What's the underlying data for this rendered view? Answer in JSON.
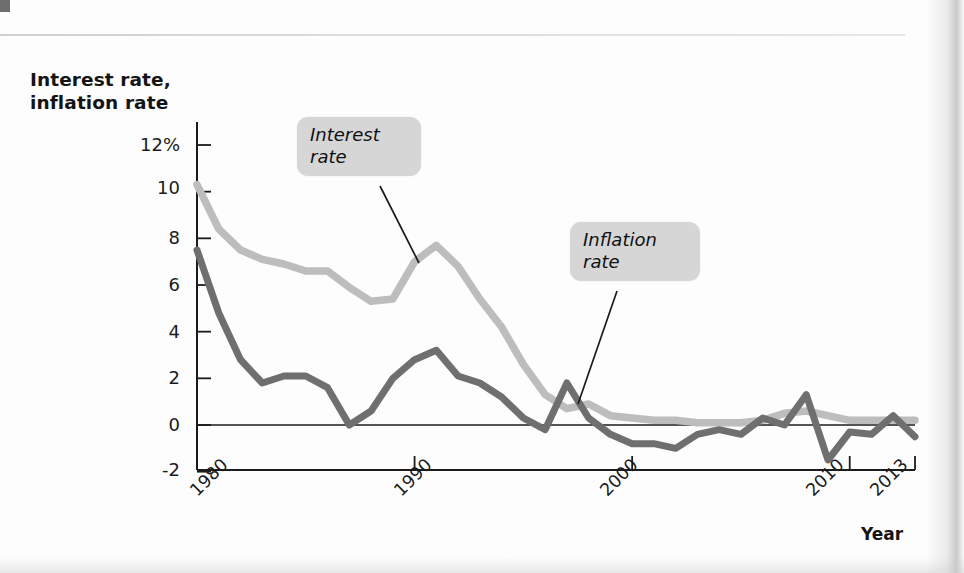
{
  "figure": {
    "y_axis_title_line1": "Interest rate,",
    "y_axis_title_line2": "inflation rate",
    "x_axis_title": "Year"
  },
  "annotations": [
    {
      "name": "interest-rate-callout",
      "line1": "Interest",
      "line2": "rate"
    },
    {
      "name": "inflation-rate-callout",
      "line1": "Inflation",
      "line2": "rate"
    }
  ],
  "colors": {
    "interest_rate_line": "#bdbdbd",
    "inflation_rate_line": "#6f6f6f",
    "axis": "#1b1b1b",
    "callout_background": "#d6d6d6"
  },
  "chart_data": {
    "type": "line",
    "title": "",
    "subtitle": "",
    "xlabel": "Year",
    "ylabel": "Interest rate, inflation rate",
    "xlim": [
      1980,
      2013
    ],
    "ylim": [
      -2,
      13
    ],
    "grid": false,
    "legend": "annotated-callouts",
    "ytick_labels": [
      "12%",
      "10",
      "8",
      "6",
      "4",
      "2",
      "0",
      "-2"
    ],
    "ytick_values": [
      12,
      10,
      8,
      6,
      4,
      2,
      0,
      -2
    ],
    "xtick_labels": [
      "1980",
      "1990",
      "2000",
      "2010",
      "2013"
    ],
    "xtick_values": [
      1980,
      1990,
      2000,
      2010,
      2013
    ],
    "x": [
      1980,
      1981,
      1982,
      1983,
      1984,
      1985,
      1986,
      1987,
      1988,
      1989,
      1990,
      1991,
      1992,
      1993,
      1994,
      1995,
      1996,
      1997,
      1998,
      1999,
      2000,
      2001,
      2002,
      2003,
      2004,
      2005,
      2006,
      2007,
      2008,
      2009,
      2010,
      2011,
      2012,
      2013
    ],
    "series": [
      {
        "name": "Interest rate",
        "color": "#bdbdbd",
        "values": [
          10.3,
          8.4,
          7.5,
          7.1,
          6.9,
          6.6,
          6.6,
          5.9,
          5.3,
          5.4,
          7.0,
          7.7,
          6.8,
          5.4,
          4.2,
          2.6,
          1.3,
          0.7,
          0.9,
          0.4,
          0.3,
          0.2,
          0.2,
          0.1,
          0.1,
          0.1,
          0.2,
          0.5,
          0.6,
          0.4,
          0.2,
          0.2,
          0.2,
          0.2
        ]
      },
      {
        "name": "Inflation rate",
        "color": "#6f6f6f",
        "values": [
          7.5,
          4.8,
          2.8,
          1.8,
          2.1,
          2.1,
          1.6,
          0.0,
          0.6,
          2.0,
          2.8,
          3.2,
          2.1,
          1.8,
          1.2,
          0.3,
          -0.2,
          1.8,
          0.3,
          -0.4,
          -0.8,
          -0.8,
          -1.0,
          -0.4,
          -0.2,
          -0.4,
          0.3,
          0.0,
          1.3,
          -1.5,
          -0.3,
          -0.4,
          0.4,
          -0.5
        ]
      }
    ],
    "annotations": [
      {
        "text": "Interest rate",
        "points_to_x": 1989,
        "points_to_y": 5.6
      },
      {
        "text": "Inflation rate",
        "points_to_x": 1997,
        "points_to_y": 1.4
      }
    ]
  }
}
